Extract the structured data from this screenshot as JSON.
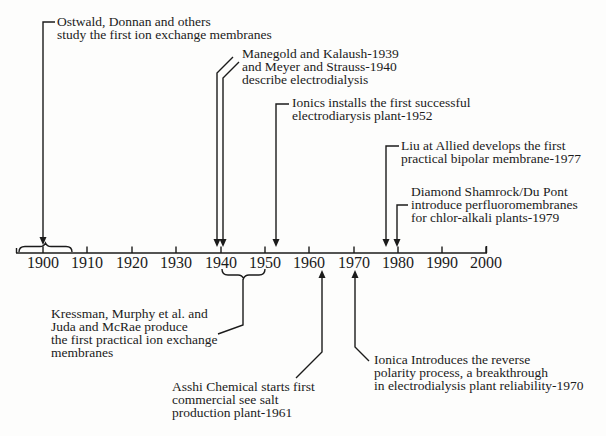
{
  "colors": {
    "ink": "#1b1b1b",
    "background": "#fdfdfc"
  },
  "timeline": {
    "years": [
      "1900",
      "1910",
      "1920",
      "1930",
      "1940",
      "1950",
      "1960",
      "1970",
      "1980",
      "1990",
      "2000"
    ]
  },
  "annotations": {
    "ostwald": {
      "lines": [
        "Ostwald, Donnan and others",
        "study the first ion exchange membranes"
      ]
    },
    "manegold": {
      "lines": [
        "Manegold and Kalaush-1939",
        "and Meyer and Strauss-1940",
        "describe electrodialysis"
      ]
    },
    "ionics": {
      "lines": [
        "Ionics installs the first successful",
        "electrodiarysis plant-1952"
      ]
    },
    "liu": {
      "lines": [
        "Liu at Allied develops the first",
        "practical bipolar membrane-1977"
      ]
    },
    "diamond": {
      "lines": [
        "Diamond Shamrock/Du Pont",
        "introduce perfluoromembranes",
        "for chlor-alkali plants-1979"
      ]
    },
    "kressman": {
      "lines": [
        "Kressman, Murphy et al. and",
        "Juda and McRae produce",
        "the first practical ion exchange",
        "membranes"
      ]
    },
    "asahi": {
      "lines": [
        "Asshi Chemical starts first",
        "commercial see salt",
        "production plant-1961"
      ]
    },
    "ionica": {
      "lines": [
        "Ionica Introduces the reverse",
        "polarity process, a breakthrough",
        "in electrodialysis plant reliability-1970"
      ]
    }
  }
}
